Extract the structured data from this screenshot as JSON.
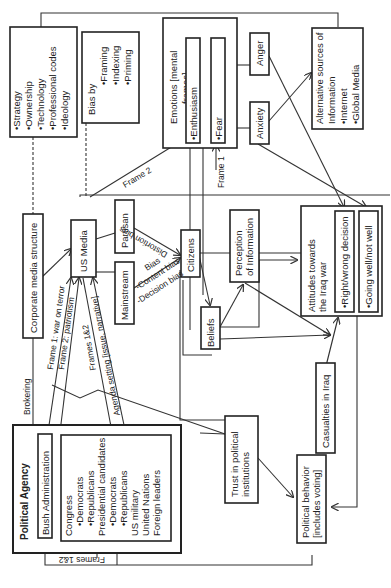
{
  "diagram": {
    "nodes": {
      "strategy_box": [
        "•Strategy",
        "•Ownership",
        "•Technology",
        "•Professional codes",
        "•Ideology"
      ],
      "bias_by": {
        "title": "Bias by",
        "items": [
          "•Framing",
          "•Indexing",
          "•Priming"
        ]
      },
      "emotions": {
        "title": "Emotions [mental",
        "title2": "frames]",
        "enthusiasm": "•Enthusiasm",
        "fear": "•Fear"
      },
      "anger": "Anger",
      "anxiety": "Anxiety",
      "alternative_sources": {
        "line1": "Alternative sources of",
        "line2": "Information",
        "item1": "•Internet",
        "item2": "•Global Media"
      },
      "corporate_media": "Corporate media structure",
      "us_media": "US Media",
      "partisan": "Partisan",
      "mainstream": "Mainstream",
      "citizens": "Citizens",
      "perception": {
        "line1": "Perception",
        "line2": "of Information"
      },
      "beliefs": "Beliefs",
      "attitudes": {
        "line1": "Attitudes towards",
        "line2": "the Iraq war",
        "item1": "•Right/wrong decision",
        "item2": "•Going well/not well"
      },
      "casualties": "Casualties in Iraq",
      "trust": {
        "line1": "Trust in political",
        "line2": "institutions"
      },
      "political_behavior": {
        "line1": "Political behavior",
        "line2": "[includes voting]"
      },
      "political_agency": "Political Agency",
      "bush": "Bush Administration",
      "actors": [
        "Congress",
        "•Democrats",
        "•Republicans",
        "Presidential candidates",
        "•Democrats",
        "•Republicans",
        "US military",
        "United Nations",
        "Foreign leaders"
      ]
    },
    "edge_labels": {
      "frame2": "Frame 2",
      "frame1": "Frame 1",
      "distortion_bias": "Distortion bias",
      "bias": "Bias",
      "content_bias": "-Content bias",
      "decision_bias": "-Decision bias",
      "brokering": "Brokering",
      "frame1_war": "Frame 1: war on terror",
      "frame2_patriotism": "Frame 2: patriotism",
      "frames12": "Frames 1&2",
      "agenda_setting": "Agenda setting [issue, narrative]",
      "frames12_bottom": "Frames 1&2"
    }
  }
}
